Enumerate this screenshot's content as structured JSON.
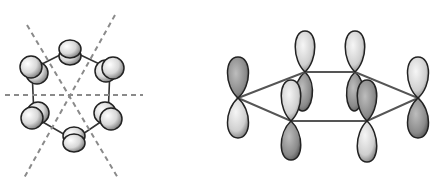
{
  "figure": {
    "colors": {
      "background": "#ffffff",
      "outline": "#2a2a2a",
      "bond": "#555555",
      "dashed_axis": "#8a8a8a",
      "lobe_light": "#f2f2f2",
      "lobe_dark": "#6a6a6a"
    },
    "top_view": {
      "atoms": [
        {
          "x": 70,
          "y": 50
        },
        {
          "x": 110,
          "y": 69
        },
        {
          "x": 108,
          "y": 117
        },
        {
          "x": 74,
          "y": 140
        },
        {
          "x": 34,
          "y": 117
        },
        {
          "x": 32,
          "y": 69
        }
      ],
      "axes": [
        {
          "x1": 5,
          "y1": 95,
          "x2": 143,
          "y2": 95
        },
        {
          "x1": 27,
          "y1": 25,
          "x2": 118,
          "y2": 178
        },
        {
          "x1": 115,
          "y1": 15,
          "x2": 24,
          "y2": 178
        }
      ]
    },
    "side_view": {
      "atoms": [
        {
          "x": 238,
          "y": 98
        },
        {
          "x": 305,
          "y": 72
        },
        {
          "x": 355,
          "y": 72
        },
        {
          "x": 418,
          "y": 98
        },
        {
          "x": 367,
          "y": 121
        },
        {
          "x": 291,
          "y": 121
        }
      ]
    }
  }
}
